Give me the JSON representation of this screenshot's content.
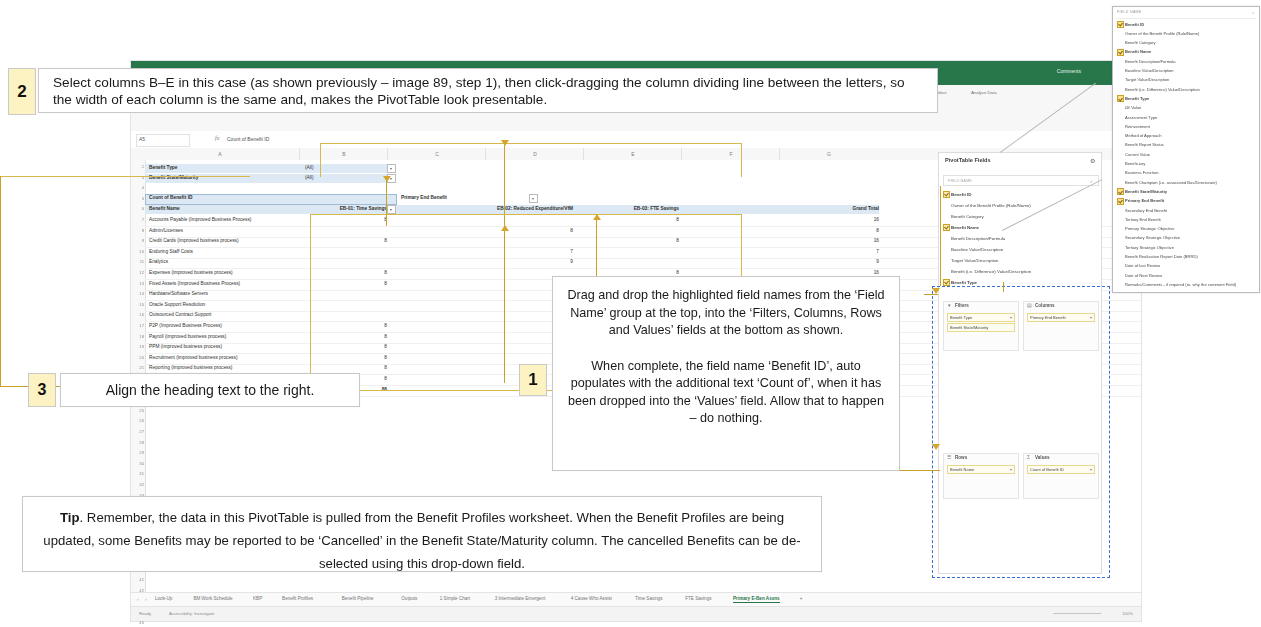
{
  "excel": {
    "title_bar": {
      "comments": "Comments",
      "share": "Share"
    },
    "formula_bar": {
      "name_box": "A5",
      "fx": "fx",
      "value": "Count of Benefit ID"
    },
    "ribbon": {
      "paste": "Paste",
      "format_painter": "Format",
      "bold": "B",
      "italic": "I",
      "underline": "U",
      "merge": "Merge & Centre",
      "conditional": "Conditional",
      "formatting": "Formatting",
      "format_as_table": "Format as Table",
      "insert": "Insert",
      "delete": "Delete",
      "format": "Format",
      "sort_filter": "Sort & Filter",
      "find_select": "Find & Select",
      "analyse_data": "Analyse Data",
      "clear": "Clear"
    },
    "columns": [
      "A",
      "B",
      "C",
      "D",
      "E",
      "F",
      "G"
    ],
    "row_numbers": [
      "2",
      "3",
      "4",
      "5",
      "6",
      "7",
      "8",
      "9",
      "10",
      "11",
      "12",
      "13",
      "14",
      "15",
      "16",
      "17",
      "18",
      "19",
      "20",
      "21",
      "22",
      "23",
      "24",
      "25",
      "26",
      "27",
      "28",
      "29",
      "30",
      "31",
      "32",
      "33",
      "34",
      "35",
      "36",
      "37",
      "38",
      "39",
      "40",
      "41",
      "42",
      "43",
      "44",
      "45",
      "46",
      "47",
      "48"
    ],
    "filters": [
      {
        "label": "Benefit Type",
        "value": "(All)"
      },
      {
        "label": "Benefit State/Maturity",
        "value": "(All)"
      }
    ],
    "pivot": {
      "values_caption": "Count of Benefit ID",
      "columns_caption": "Primary End Benefit",
      "rows_caption": "Benefit Name",
      "column_headers": [
        "EB-01: Time Savings",
        "EB-02: Reduced Expenditure/VfM",
        "EB-03: FTE Savings",
        "Grand Total"
      ],
      "rows": [
        {
          "name": "Accounts Payable (Improved Business Process)",
          "v1": "8",
          "v2": "",
          "v3": "8",
          "total": "16"
        },
        {
          "name": "Admin/Licenses",
          "v1": "",
          "v2": "8",
          "v3": "",
          "total": "8"
        },
        {
          "name": "Credit Cards (improved business process)",
          "v1": "8",
          "v2": "",
          "v3": "8",
          "total": "16"
        },
        {
          "name": "Enduring Staff Costs",
          "v1": "",
          "v2": "7",
          "v3": "",
          "total": "7"
        },
        {
          "name": "Enalytics",
          "v1": "",
          "v2": "9",
          "v3": "",
          "total": "9"
        },
        {
          "name": "Expenses (improved business process)",
          "v1": "8",
          "v2": "",
          "v3": "8",
          "total": "16"
        },
        {
          "name": "Fixed Assets (Improved Business Process)",
          "v1": "8",
          "v2": "",
          "v3": "",
          "total": "8"
        },
        {
          "name": "Hardware/Software Servers",
          "v1": "",
          "v2": "8",
          "v3": "",
          "total": "8"
        },
        {
          "name": "Oracle Support Resolution",
          "v1": "",
          "v2": "9",
          "v3": "",
          "total": "9"
        },
        {
          "name": "Outsourced Contract Support",
          "v1": "",
          "v2": "9",
          "v3": "",
          "total": "9"
        },
        {
          "name": "P2P (Improved Business Process)",
          "v1": "8",
          "v2": "",
          "v3": "",
          "total": "8"
        },
        {
          "name": "Payroll (improved business process)",
          "v1": "8",
          "v2": "",
          "v3": "",
          "total": "8"
        },
        {
          "name": "PPM (improved business process)",
          "v1": "8",
          "v2": "",
          "v3": "",
          "total": "8"
        },
        {
          "name": "Recruitment (improved business process)",
          "v1": "8",
          "v2": "",
          "v3": "",
          "total": "8"
        },
        {
          "name": "Reporting (improved business process)",
          "v1": "8",
          "v2": "",
          "v3": "",
          "total": "8"
        },
        {
          "name": "Supplier Management (Improved Business Process)",
          "v1": "8",
          "v2": "",
          "v3": "",
          "total": "8"
        },
        {
          "name": "Grand Total",
          "v1": "88",
          "v2": "",
          "v3": "88",
          "total": ""
        }
      ]
    },
    "sheet_tabs": [
      "Look-Up",
      "BM Work Schedule",
      "KBP",
      "Benefit Profiles",
      "Benefit Pipeline",
      "Outputs",
      "1 Simple Chart",
      "3 Intermediate Emergent",
      "4 Cause Who Assist",
      "Time Savings",
      "FTE Savings",
      "Primary E-Ben Assns"
    ],
    "active_sheet_tab": "Primary E-Ben Assns",
    "add_sheet": "+",
    "status": {
      "ready": "Ready",
      "accessibility": "Accessibility: Investigate",
      "zoom": "100%"
    }
  },
  "pivot_pane": {
    "title": "PivotTable Fields",
    "gear_icon": "gear-icon",
    "subtitle": "Choose fields to add to report:",
    "search_placeholder": "FIELD NAME",
    "search_icon": "search-icon",
    "fields": [
      {
        "label": "Benefit ID",
        "checked": true
      },
      {
        "label": "Owner of the Benefit Profile (Role/Name)",
        "checked": false
      },
      {
        "label": "Benefit Category",
        "checked": false
      },
      {
        "label": "Benefit Name",
        "checked": true
      },
      {
        "label": "Benefit Description/Formula",
        "checked": false
      },
      {
        "label": "Baseline Value/Description",
        "checked": false
      },
      {
        "label": "Target Value/Description",
        "checked": false
      },
      {
        "label": "Benefit (i.e. Difference) Value/Description",
        "checked": false
      },
      {
        "label": "Benefit Type",
        "checked": true
      }
    ],
    "areas": {
      "filters": {
        "label": "Filters",
        "icon": "filter-icon",
        "chips": [
          "Benefit Type",
          "Benefit State/Maturity"
        ]
      },
      "columns": {
        "label": "Columns",
        "icon": "columns-icon",
        "chips": [
          "Primary End Benefit"
        ]
      },
      "rows": {
        "label": "Rows",
        "icon": "rows-icon",
        "chips": [
          "Benefit Name"
        ]
      },
      "values": {
        "label": "Values",
        "icon": "sigma-icon",
        "chips": [
          "Count of Benefit ID"
        ]
      }
    }
  },
  "zoom_field_list": {
    "header": "FIELD NAME",
    "search_icon": "search-icon",
    "fields": [
      {
        "label": "Benefit ID",
        "checked": true
      },
      {
        "label": "Owner of the Benefit Profile (Role/Name)",
        "checked": false
      },
      {
        "label": "Benefit Category",
        "checked": false
      },
      {
        "label": "Benefit Name",
        "checked": true
      },
      {
        "label": "Benefit Description/Formula",
        "checked": false
      },
      {
        "label": "Baseline Value/Description",
        "checked": false
      },
      {
        "label": "Target Value/Description",
        "checked": false
      },
      {
        "label": "Benefit (i.e. Difference) Value/Description",
        "checked": false
      },
      {
        "label": "Benefit Type",
        "checked": true
      },
      {
        "label": "£E Value",
        "checked": false
      },
      {
        "label": "Assessment Type",
        "checked": false
      },
      {
        "label": "Reinvestment",
        "checked": false
      },
      {
        "label": "Method of Approach",
        "checked": false
      },
      {
        "label": "Benefit Report Status",
        "checked": false
      },
      {
        "label": "Current Value",
        "checked": false
      },
      {
        "label": "Beneficiary",
        "checked": false
      },
      {
        "label": "Business Function",
        "checked": false
      },
      {
        "label": "Benefit Champion (i.e. associated Bus/Directorate)",
        "checked": false
      },
      {
        "label": "Benefit State/Maturity",
        "checked": true
      },
      {
        "label": "Primary End Benefit",
        "checked": true
      },
      {
        "label": "Secondary End Benefit",
        "checked": false
      },
      {
        "label": "Tertiary End Benefit",
        "checked": false
      },
      {
        "label": "Primary Strategic Objective",
        "checked": false
      },
      {
        "label": "Secondary Strategic Objective",
        "checked": false
      },
      {
        "label": "Tertiary Strategic Objective",
        "checked": false
      },
      {
        "label": "Benefit Realisation Report Date (BRRD)",
        "checked": false
      },
      {
        "label": "Date of last Review",
        "checked": false
      },
      {
        "label": "Date of Next Review",
        "checked": false
      },
      {
        "label": "Remarks/Comments - if required (re. why the comment Field)",
        "checked": false
      }
    ]
  },
  "callouts": {
    "step2": {
      "number": "2",
      "text": "Select columns B–E in this case (as shown previously – image 89, step 1), then click-dragging the column dividing line between the letters, so the width of each column is the same and, makes the PivotTable look presentable."
    },
    "step3": {
      "number": "3",
      "text": "Align the heading text to the right."
    },
    "step1": {
      "number": "1",
      "paragraph1": "Drag and drop the highlighted field names from the ‘Field Name’ group at the top, into the ‘Filters, Columns, Rows and Values’ fields at the bottom as shown.",
      "paragraph2": "When complete, the field name ‘Benefit ID’, auto populates with the additional text ‘Count of’, when it has been dropped into the ‘Values’ field. Allow that to happen – do nothing."
    },
    "tip": {
      "label": "Tip",
      "text": ". Remember, the data in this PivotTable is pulled from the Benefit Profiles worksheet.  When the Benefit Profiles are being updated, some Benefits may be reported to be ‘Cancelled’ in the Benefit State/Maturity column.  The cancelled Benefits can be de-selected using this drop-down field."
    }
  },
  "colors": {
    "excel_green": "#217346",
    "step_badge": "#fdf2c2",
    "annotation_gold": "#d4a72c",
    "annotation_blue": "#3b6fd4",
    "pivot_header_blue": "#dce9f4"
  }
}
